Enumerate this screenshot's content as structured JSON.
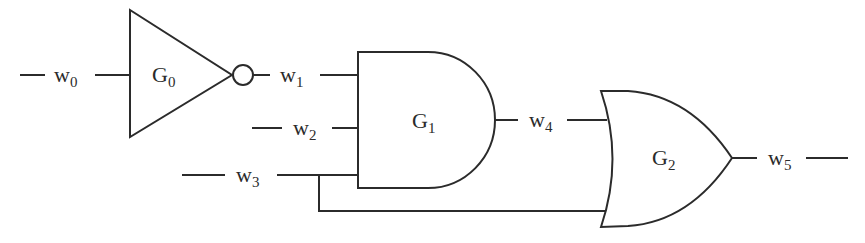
{
  "diagram": {
    "type": "logic-circuit",
    "stroke_color": "#2b2b2b",
    "background": "#ffffff",
    "gates": [
      {
        "id": "G0",
        "base": "G",
        "sub": "0",
        "kind": "NOT",
        "inputs": [
          "w0"
        ],
        "output": "w1"
      },
      {
        "id": "G1",
        "base": "G",
        "sub": "1",
        "kind": "AND",
        "inputs": [
          "w1",
          "w2",
          "w3"
        ],
        "output": "w4"
      },
      {
        "id": "G2",
        "base": "G",
        "sub": "2",
        "kind": "OR",
        "inputs": [
          "w4",
          "w3"
        ],
        "output": "w5"
      }
    ],
    "wires": [
      {
        "id": "w0",
        "base": "w",
        "sub": "0"
      },
      {
        "id": "w1",
        "base": "w",
        "sub": "1"
      },
      {
        "id": "w2",
        "base": "w",
        "sub": "2"
      },
      {
        "id": "w3",
        "base": "w",
        "sub": "3"
      },
      {
        "id": "w4",
        "base": "w",
        "sub": "4"
      },
      {
        "id": "w5",
        "base": "w",
        "sub": "5"
      }
    ]
  }
}
